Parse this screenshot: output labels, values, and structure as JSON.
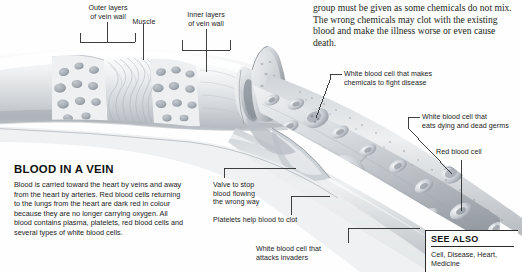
{
  "figure": {
    "title": "BLOOD IN A VEIN",
    "body": "Blood is carried toward the heart by veins and away from the heart by arteries. Red blood cells returning to the lungs from the heart are dark red in colour because they are no longer carrying oxygen. All blood contains plasma, platelets, red blood cells and several types of white blood cells."
  },
  "intro": {
    "text": "group must be given as some chemicals do not mix. The wrong chemicals may clot with the existing blood and make the illness worse or even cause death."
  },
  "labels": {
    "outer_layers": "Outer layers\nof vein wall",
    "muscle": "Muscle",
    "inner_layers": "Inner layers\nof vein wall",
    "wbc_chemicals": "White blood cell that makes\nchemicals to fight disease",
    "wbc_eats": "White blood cell that\neats dying and dead germs",
    "red_blood_cell": "Red blood cell",
    "valve": "Valve to stop\nblood flowing\nthe wrong way",
    "platelets": "Platelets help blood to clot",
    "wbc_attacks": "White blood cell that\nattacks invaders"
  },
  "see_also": {
    "title": "SEE ALSO",
    "items": "Cell, Disease, Heart,\nMedicine"
  },
  "colors": {
    "ink": "#1b1b1b",
    "rule": "#2a2a2a",
    "background": "#ffffff",
    "illustration_gray": "#b9bcc0"
  },
  "illustration": {
    "subject": "cutaway-vein-with-blood-cells"
  }
}
